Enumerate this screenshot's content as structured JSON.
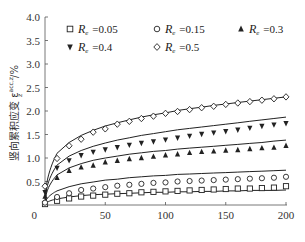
{
  "chart_data": {
    "type": "scatter",
    "title": "",
    "xlabel": "",
    "ylabel": "竖向累积应变 ε_z^acc,z /%",
    "xlim": [
      0,
      200
    ],
    "ylim": [
      0,
      4.0
    ],
    "x_ticks": [
      0,
      50,
      100,
      150,
      200
    ],
    "x_tick_labels": [
      "0",
      "50",
      "100",
      "150",
      "200"
    ],
    "y_ticks": [
      0,
      0.5,
      1.0,
      1.5,
      2.0,
      2.5,
      3.0,
      3.5,
      4.0
    ],
    "y_tick_labels": [
      "0",
      "0.5",
      "1.0",
      "1.5",
      "2.0",
      "2.5",
      "3.0",
      "3.5",
      "4.0"
    ],
    "grid": false,
    "legend_position": "top-inside",
    "x": [
      0,
      10,
      20,
      30,
      40,
      50,
      60,
      70,
      80,
      90,
      100,
      110,
      120,
      130,
      140,
      150,
      160,
      170,
      180,
      190,
      200
    ],
    "series": [
      {
        "name": "R_e=0.05",
        "label_var": "R",
        "label_sub": "e",
        "label_val": "=0.05",
        "marker": "square-open",
        "values": [
          0.02,
          0.09,
          0.14,
          0.18,
          0.2,
          0.22,
          0.24,
          0.25,
          0.27,
          0.28,
          0.29,
          0.3,
          0.31,
          0.32,
          0.33,
          0.34,
          0.35,
          0.35,
          0.36,
          0.37,
          0.4
        ],
        "fit": [
          0.0,
          0.13,
          0.17,
          0.2,
          0.22,
          0.23,
          0.24,
          0.25,
          0.26,
          0.27,
          0.27,
          0.28,
          0.28,
          0.29,
          0.29,
          0.3,
          0.3,
          0.31,
          0.31,
          0.31,
          0.32
        ]
      },
      {
        "name": "R_e=0.15",
        "label_var": "R",
        "label_sub": "e",
        "label_val": "=0.15",
        "marker": "circle-open",
        "values": [
          0.05,
          0.17,
          0.25,
          0.32,
          0.35,
          0.38,
          0.41,
          0.43,
          0.45,
          0.47,
          0.48,
          0.5,
          0.51,
          0.52,
          0.53,
          0.54,
          0.55,
          0.56,
          0.57,
          0.58,
          0.6
        ],
        "fit": [
          0.0,
          0.3,
          0.39,
          0.45,
          0.49,
          0.53,
          0.55,
          0.58,
          0.6,
          0.62,
          0.63,
          0.65,
          0.66,
          0.67,
          0.68,
          0.69,
          0.7,
          0.71,
          0.72,
          0.73,
          0.74
        ]
      },
      {
        "name": "R_e=0.3",
        "label_var": "R",
        "label_sub": "e",
        "label_val": "=0.3",
        "marker": "triangle-up-filled",
        "values": [
          0.18,
          0.58,
          0.73,
          0.8,
          0.84,
          0.91,
          0.94,
          0.98,
          1.0,
          1.03,
          1.06,
          1.08,
          1.11,
          1.13,
          1.14,
          1.16,
          1.17,
          1.19,
          1.21,
          1.22,
          1.26
        ],
        "fit": [
          0.0,
          0.64,
          0.79,
          0.88,
          0.95,
          1.0,
          1.04,
          1.08,
          1.11,
          1.14,
          1.16,
          1.19,
          1.21,
          1.23,
          1.25,
          1.27,
          1.29,
          1.31,
          1.33,
          1.36,
          1.38
        ]
      },
      {
        "name": "R_e=0.4",
        "label_var": "R",
        "label_sub": "e",
        "label_val": "=0.4",
        "marker": "triangle-down-filled",
        "values": [
          0.27,
          0.79,
          0.95,
          1.06,
          1.13,
          1.18,
          1.23,
          1.28,
          1.32,
          1.35,
          1.39,
          1.43,
          1.47,
          1.51,
          1.54,
          1.57,
          1.6,
          1.64,
          1.68,
          1.71,
          1.74
        ],
        "fit": [
          0.0,
          0.85,
          1.04,
          1.16,
          1.25,
          1.32,
          1.38,
          1.43,
          1.48,
          1.52,
          1.56,
          1.6,
          1.63,
          1.66,
          1.69,
          1.72,
          1.75,
          1.78,
          1.81,
          1.84,
          1.87
        ]
      },
      {
        "name": "R_e=0.5",
        "label_var": "R",
        "label_sub": "e",
        "label_val": "=0.5",
        "marker": "diamond-open",
        "values": [
          0.4,
          0.99,
          1.26,
          1.4,
          1.55,
          1.62,
          1.72,
          1.78,
          1.84,
          1.89,
          1.95,
          1.99,
          2.03,
          2.07,
          2.1,
          2.14,
          2.17,
          2.2,
          2.23,
          2.26,
          2.3
        ],
        "fit": [
          0.0,
          1.1,
          1.33,
          1.48,
          1.59,
          1.68,
          1.75,
          1.81,
          1.87,
          1.92,
          1.96,
          2.01,
          2.05,
          2.08,
          2.12,
          2.15,
          2.18,
          2.21,
          2.24,
          2.27,
          2.3
        ]
      }
    ]
  },
  "axes": {
    "ylabel_text": "竖向累积应变 ε",
    "ylabel_sup": "acc,z",
    "ylabel_sub": "z",
    "ylabel_unit": "/%"
  }
}
